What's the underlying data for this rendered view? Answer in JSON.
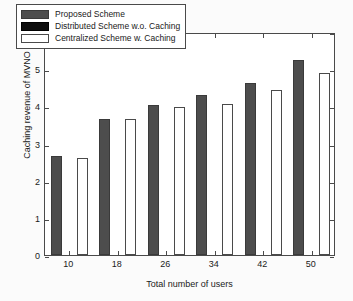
{
  "chart_data": {
    "type": "bar",
    "title": "",
    "xlabel": "Total number of users",
    "ylabel": "Caching revenue of MVNO",
    "y_multiplier": "x 10",
    "y_multiplier_exponent": "4",
    "categories": [
      "10",
      "18",
      "26",
      "34",
      "42",
      "50"
    ],
    "xlim": [
      0,
      6
    ],
    "ylim": [
      0,
      6
    ],
    "yticks": [
      "0",
      "1",
      "2",
      "3",
      "4",
      "5",
      "6"
    ],
    "ytick_values": [
      0,
      1,
      2,
      3,
      4,
      5,
      6
    ],
    "grid": false,
    "legend_position": "upper left",
    "series": [
      {
        "name": "Proposed Scheme",
        "color": "#4d4d4d",
        "values": [
          2.66,
          3.65,
          4.03,
          4.3,
          4.62,
          5.25
        ]
      },
      {
        "name": "Distributed Scheme w.o. Caching",
        "color": "#0d0d0d",
        "values": [
          0,
          0,
          0,
          0,
          0,
          0
        ]
      },
      {
        "name": "Centralized Scheme w. Caching",
        "color": "#ffffff",
        "values": [
          2.62,
          3.65,
          3.98,
          4.06,
          4.44,
          4.9
        ]
      }
    ]
  },
  "axis": {
    "frame_color": "#4a4a4a",
    "background": "#ffffff"
  }
}
